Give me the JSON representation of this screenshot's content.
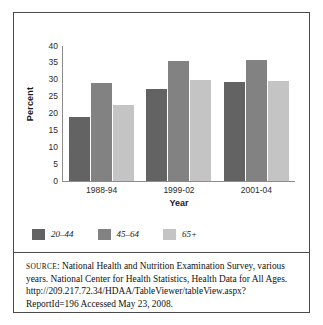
{
  "figure": {
    "source_label": "Source",
    "source_text": ": National Health and Nutrition Examination Survey, various years. National Center for Health Statistics, Health Data for All Ages. http://209.217.72.34/HDAA/TableViewer/tableView.aspx?ReportId=196 Accessed May 23, 2008."
  },
  "chart_data": {
    "type": "bar",
    "title": "",
    "xlabel": "Year",
    "ylabel": "Percent",
    "categories": [
      "1988-94",
      "1999-02",
      "2001-04"
    ],
    "ylim": [
      0,
      40
    ],
    "yticks": [
      40,
      35,
      30,
      25,
      20,
      15,
      10,
      5,
      0
    ],
    "grid": false,
    "legend_position": "bottom-left",
    "series": [
      {
        "name": "20–44",
        "color": "#636363",
        "values": [
          19.0,
          27.3,
          29.2
        ]
      },
      {
        "name": "45–64",
        "color": "#828282",
        "values": [
          29.1,
          35.7,
          35.9
        ]
      },
      {
        "name": "65+",
        "color": "#c4c4c4",
        "values": [
          22.4,
          29.9,
          29.5
        ]
      }
    ]
  }
}
